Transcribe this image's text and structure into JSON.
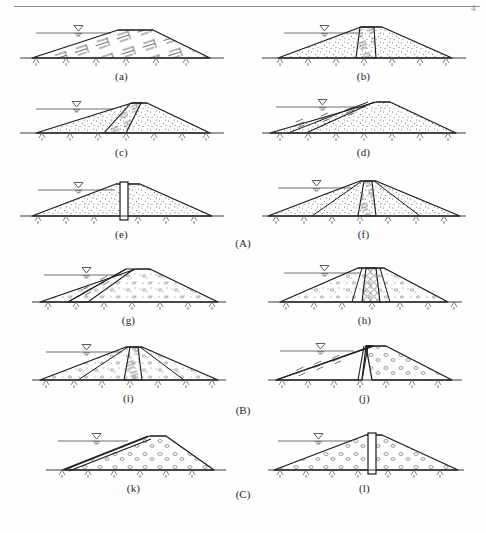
{
  "figure": {
    "page_marker": "4",
    "groups": [
      {
        "id": "A",
        "label": "(A)",
        "name": "earthfill-dams"
      },
      {
        "id": "B",
        "label": "(B)",
        "name": "earth-rockfill-dams"
      },
      {
        "id": "C",
        "label": "(C)",
        "name": "rockfill-dams"
      }
    ],
    "panels": [
      {
        "key": "a",
        "label": "(a)",
        "group": "A",
        "type": "homogeneous-earthfill",
        "fill": "clay",
        "core": "none",
        "water_symbol": true
      },
      {
        "key": "b",
        "label": "(b)",
        "group": "A",
        "type": "zoned-earthfill-central-core",
        "fill": "sand",
        "core": "vertical-clay-core",
        "water_symbol": true
      },
      {
        "key": "c",
        "label": "(c)",
        "group": "A",
        "type": "zoned-earthfill-inclined-core",
        "fill": "sand",
        "core": "inclined-clay-core",
        "water_symbol": true
      },
      {
        "key": "d",
        "label": "(d)",
        "group": "A",
        "type": "earthfill-upstream-clay-blanket",
        "fill": "sand",
        "core": "upstream-sloping-clay-facing",
        "water_symbol": true
      },
      {
        "key": "e",
        "label": "(e)",
        "group": "A",
        "type": "earthfill-with-diaphragm-wall",
        "fill": "sand",
        "core": "vertical-concrete-diaphragm",
        "water_symbol": true
      },
      {
        "key": "f",
        "label": "(f)",
        "group": "A",
        "type": "earthfill-core-with-transition-zones",
        "fill": "sand",
        "core": "central-clay-core",
        "zones": "transition-filter-zones-both-sides",
        "water_symbol": true
      },
      {
        "key": "g",
        "label": "(g)",
        "group": "B",
        "type": "earth-rockfill-upstream-clay-facing",
        "fill": "rockfill",
        "core": "upstream-inclined-clay-facing",
        "water_symbol": true
      },
      {
        "key": "h",
        "label": "(h)",
        "group": "B",
        "type": "earth-rockfill-narrow-central-core",
        "fill": "rockfill",
        "core": "narrow-vertical-clay-core",
        "zones": "filter-zones-both-sides",
        "water_symbol": true
      },
      {
        "key": "i",
        "label": "(i)",
        "group": "B",
        "type": "earth-rockfill-central-core-with-transitions",
        "fill": "rockfill",
        "core": "central-clay-core",
        "zones": "transition-zones-both-sides",
        "water_symbol": true
      },
      {
        "key": "j",
        "label": "(j)",
        "group": "B",
        "type": "earth-rockfill-upstream-earth-downstream-rock",
        "fill": "clay-upstream-rockfill-downstream",
        "core": "inclined-interface-filter",
        "water_symbol": true
      },
      {
        "key": "k",
        "label": "(k)",
        "group": "C",
        "type": "concrete-faced-rockfill",
        "fill": "rockfill",
        "core": "upstream-concrete-face-slab",
        "water_symbol": true
      },
      {
        "key": "l",
        "label": "(l)",
        "group": "C",
        "type": "rockfill-with-central-diaphragm",
        "fill": "rockfill",
        "core": "vertical-concrete-diaphragm",
        "water_symbol": true
      }
    ]
  },
  "colors": {
    "line": "#1a1a1a",
    "water_line": "#6f6f6f",
    "ground": "#3a3a3a",
    "hatch": "#4a4a4a",
    "background": "#ffffff"
  }
}
